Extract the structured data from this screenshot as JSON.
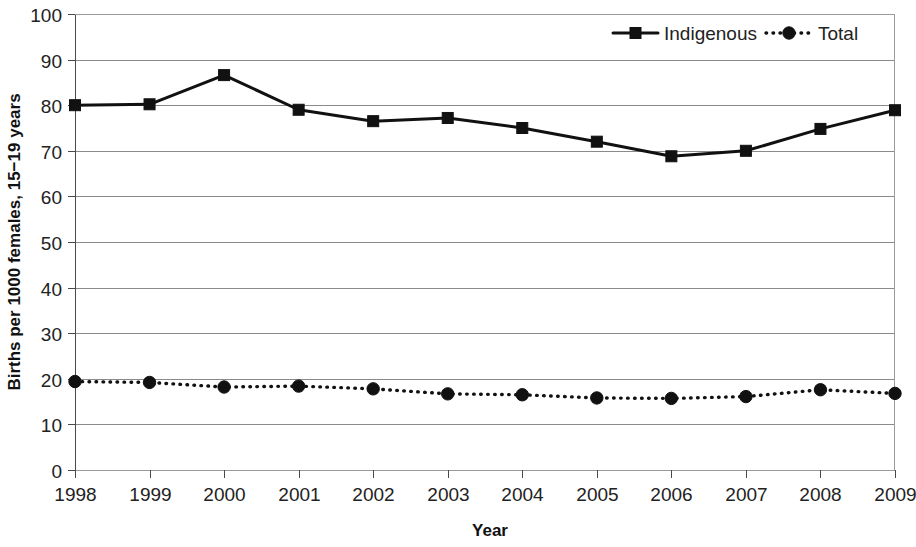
{
  "chart_data": {
    "type": "line",
    "title": "",
    "xlabel": "Year",
    "ylabel": "Births per 1000 females, 15−19 years",
    "categories": [
      "1998",
      "1999",
      "2000",
      "2001",
      "2002",
      "2003",
      "2004",
      "2005",
      "2006",
      "2007",
      "2008",
      "2009"
    ],
    "x": [
      1998,
      1999,
      2000,
      2001,
      2002,
      2003,
      2004,
      2005,
      2006,
      2007,
      2008,
      2009
    ],
    "xlim": [
      1998,
      2009
    ],
    "ylim": [
      0,
      100
    ],
    "yticks": [
      0,
      10,
      20,
      30,
      40,
      50,
      60,
      70,
      80,
      90,
      100
    ],
    "ytick_labels": [
      "0",
      "10",
      "20",
      "30",
      "40",
      "50",
      "60",
      "70",
      "80",
      "90",
      "100"
    ],
    "grid": "horizontal",
    "legend_position": "top-right",
    "series": [
      {
        "name": "Indigenous",
        "marker": "square",
        "line_style": "solid",
        "color": "#111111",
        "values": [
          80.0,
          80.2,
          86.6,
          79.0,
          76.5,
          77.2,
          75.0,
          72.0,
          68.8,
          70.0,
          74.8,
          78.9
        ]
      },
      {
        "name": "Total",
        "marker": "circle",
        "line_style": "dotted",
        "color": "#111111",
        "values": [
          19.4,
          19.2,
          18.2,
          18.4,
          17.8,
          16.7,
          16.5,
          15.8,
          15.7,
          16.1,
          17.6,
          16.8
        ]
      }
    ]
  },
  "legend": {
    "entries": [
      {
        "label": "Indigenous"
      },
      {
        "label": "Total"
      }
    ]
  },
  "axes": {
    "y_title": "Births per 1000 females, 15−19 years",
    "x_title": "Year"
  }
}
